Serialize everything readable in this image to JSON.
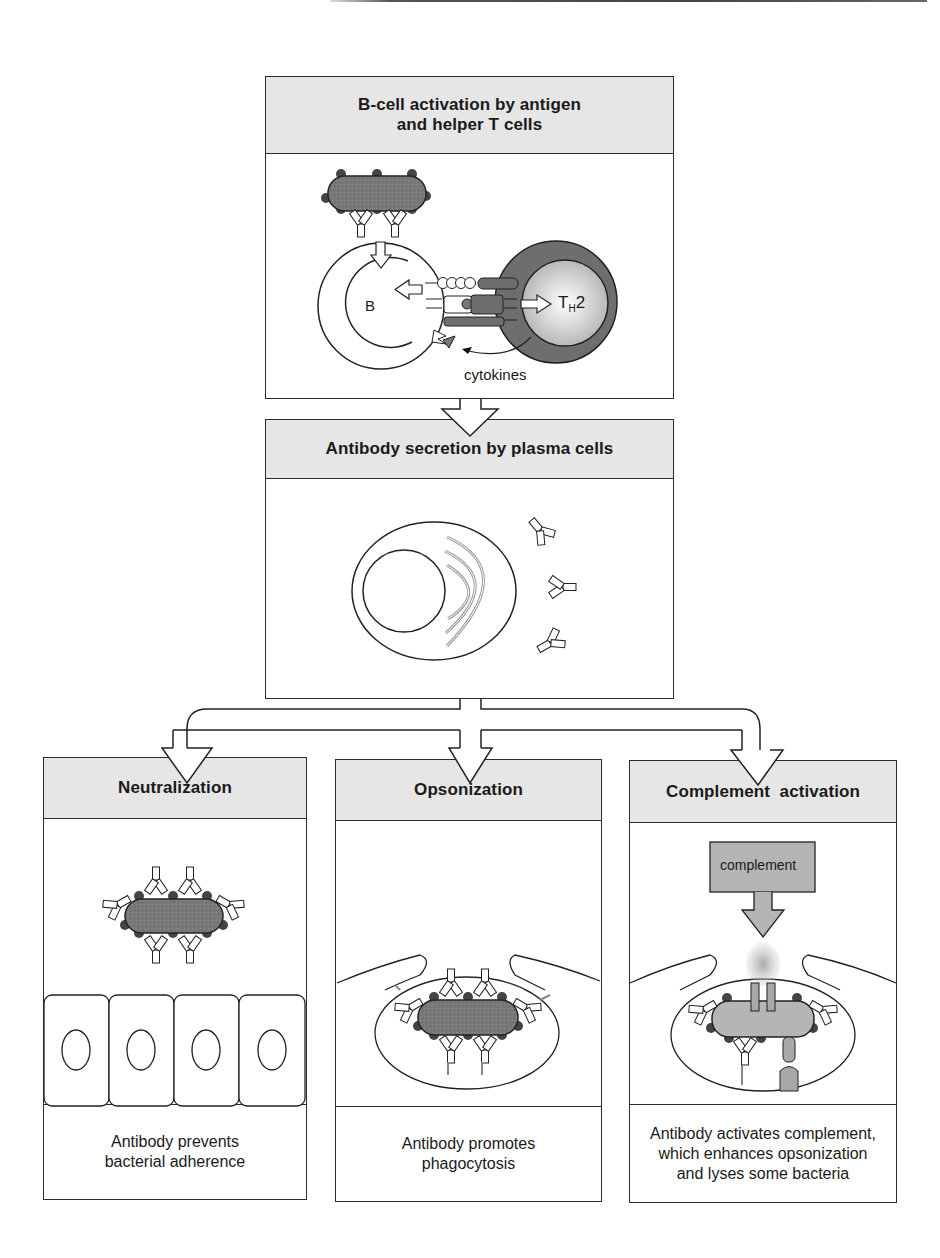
{
  "figure": {
    "colors": {
      "header_fill": "#e6e6e6",
      "outline": "#2b2b2b",
      "bacterium_fill": "#7a7a7a",
      "antigen_dot": "#4a4a4a",
      "th2_outer": "#6e6e6e",
      "complement_fill": "#b5b5b5"
    },
    "panels": {
      "activation": {
        "title": "B-cell activation by antigen\nand helper T cells",
        "labels": {
          "b_cell": "B",
          "th2_main": "T",
          "th2_sub": "H",
          "th2_num": "2",
          "cytokines": "cytokines"
        }
      },
      "secretion": {
        "title": "Antibody secretion by plasma cells"
      },
      "neutralization": {
        "title": "Neutralization",
        "caption": "Antibody prevents\nbacterial adherence"
      },
      "opsonization": {
        "title": "Opsonization",
        "caption": "Antibody promotes\nphagocytosis"
      },
      "complement": {
        "title": "Complement  activation",
        "box_label": "complement",
        "caption": "Antibody activates complement,\nwhich enhances opsonization\nand lyses some bacteria"
      }
    }
  }
}
